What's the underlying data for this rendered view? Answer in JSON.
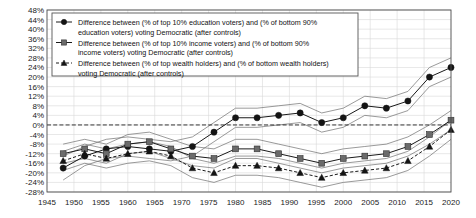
{
  "chart_data": {
    "type": "line",
    "title": "",
    "xlabel": "",
    "ylabel": "",
    "grid": true,
    "legend_position": "top-left",
    "xlim": [
      1945,
      2020
    ],
    "ylim": [
      -28,
      48
    ],
    "ytick_step": 4,
    "xtick_step": 5,
    "xticks": [
      "1945",
      "1950",
      "1955",
      "1960",
      "1965",
      "1970",
      "1975",
      "1980",
      "1985",
      "1990",
      "1995",
      "2000",
      "2005",
      "2010",
      "2015",
      "2020"
    ],
    "yticks": [
      "48%",
      "44%",
      "40%",
      "36%",
      "32%",
      "28%",
      "24%",
      "20%",
      "16%",
      "12%",
      "8%",
      "4%",
      "0%",
      "-4%",
      "-8%",
      "-12%",
      "-16%",
      "-20%",
      "-24%",
      "-28%"
    ],
    "zero_reference_line": 0,
    "x": [
      1948,
      1952,
      1956,
      1960,
      1964,
      1968,
      1972,
      1976,
      1980,
      1984,
      1988,
      1992,
      1996,
      2000,
      2004,
      2008,
      2012,
      2016,
      2020
    ],
    "series": [
      {
        "name": "education",
        "marker": "circle",
        "linestyle": "solid",
        "values": [
          -18,
          -13,
          -10,
          -9,
          -10,
          -11,
          -9,
          -3,
          3,
          3,
          4,
          5,
          1,
          3,
          8,
          7,
          10,
          20,
          24
        ],
        "ci_low": [
          -23,
          -17,
          -14,
          -13,
          -14,
          -15,
          -13,
          -7,
          -1,
          -1,
          0,
          1,
          -3,
          -1,
          4,
          3,
          6,
          16,
          20
        ],
        "ci_high": [
          -13,
          -9,
          -6,
          -5,
          -6,
          -7,
          -5,
          1,
          7,
          7,
          8,
          9,
          5,
          7,
          12,
          11,
          14,
          24,
          28
        ]
      },
      {
        "name": "income",
        "marker": "square",
        "linestyle": "solid",
        "values": [
          -12,
          -10,
          -12,
          -8,
          -7,
          -10,
          -13,
          -14,
          -10,
          -10,
          -12,
          -14,
          -16,
          -14,
          -13,
          -12,
          -9,
          -4,
          2
        ],
        "ci_low": [
          -16,
          -14,
          -16,
          -12,
          -11,
          -14,
          -17,
          -18,
          -14,
          -14,
          -16,
          -18,
          -20,
          -18,
          -17,
          -16,
          -13,
          -8,
          -2
        ],
        "ci_high": [
          -8,
          -6,
          -8,
          -4,
          -3,
          -6,
          -9,
          -10,
          -6,
          -6,
          -8,
          -10,
          -12,
          -10,
          -9,
          -8,
          -5,
          0,
          6
        ]
      },
      {
        "name": "wealth",
        "marker": "triangle",
        "linestyle": "dashed",
        "values": [
          -15,
          -12,
          -14,
          -12,
          -11,
          -13,
          -18,
          -20,
          -17,
          -17,
          -18,
          -20,
          -22,
          -20,
          -19,
          -18,
          -15,
          -9,
          -2
        ],
        "ci_low": [
          -19,
          -16,
          -18,
          -16,
          -15,
          -17,
          -22,
          -24,
          -21,
          -21,
          -22,
          -24,
          -26,
          -24,
          -23,
          -22,
          -19,
          -13,
          -6
        ],
        "ci_high": [
          -11,
          -8,
          -10,
          -8,
          -7,
          -9,
          -14,
          -16,
          -13,
          -13,
          -14,
          -16,
          -18,
          -16,
          -15,
          -14,
          -11,
          -5,
          2
        ]
      }
    ]
  },
  "legend": {
    "items": [
      {
        "marker": "circle",
        "linestyle": "solid",
        "line1": "Difference between (% of top 10% education voters) and (% of bottom 90%",
        "line2": "education voters) voting Democratic (after controls)"
      },
      {
        "marker": "square",
        "linestyle": "solid",
        "line1": "Difference between (% of top 10% income voters) and (% of bottom 90%",
        "line2": "income voters) voting Democratic (after controls)"
      },
      {
        "marker": "triangle",
        "linestyle": "dashed",
        "line1": "Difference between (% of top wealth holders) and (% of bottom wealth holders)",
        "line2": "voting Democratic (after controls)"
      }
    ]
  },
  "colors": {
    "axis": "#4a4a4a",
    "grid": "#d8d8d8",
    "line": "#1a1a1a",
    "band": "#6e6e6e",
    "square_marker": "#6b6b6b",
    "background": "#ffffff"
  }
}
